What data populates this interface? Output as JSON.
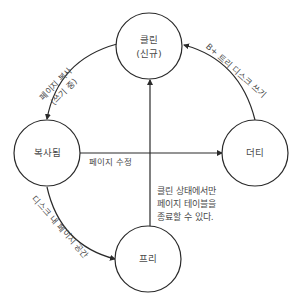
{
  "nodes": {
    "clean": {
      "line1": "클린",
      "line2": "(신규)"
    },
    "copied": {
      "label": "복사됨"
    },
    "dirty": {
      "label": "더티"
    },
    "free": {
      "label": "프리"
    }
  },
  "edges": {
    "clean_to_copied": {
      "line1": "페이지 복사",
      "line2": "(쓰기 중)"
    },
    "dirty_to_clean": {
      "label": "B+ 트리 디스크 쓰기"
    },
    "copied_to_dirty": {
      "label": "페이지 수정"
    },
    "copied_to_free": {
      "label": "디스크 내 페이지 공간"
    },
    "free_to_clean": {
      "label": ""
    }
  },
  "note": {
    "line1": "클린 상태에서만",
    "line2": "페이지 테이블을",
    "line3": "종료할 수 있다."
  },
  "colors": {
    "stroke": "#2a2a2a",
    "text": "#4a4a4a",
    "background": "#ffffff"
  }
}
